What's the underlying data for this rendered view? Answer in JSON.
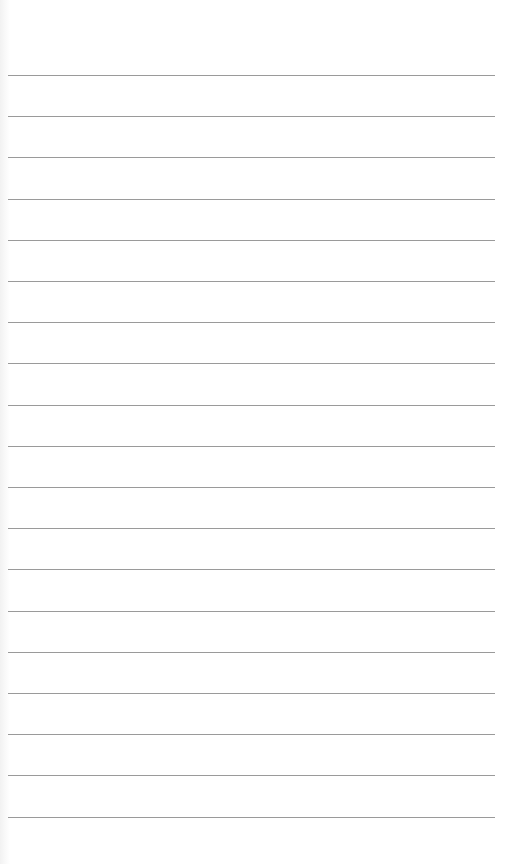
{
  "page": {
    "type": "lined-paper",
    "background_color": "#ffffff",
    "line_color": "#9a9a9a",
    "line_left": 8,
    "line_width": 487,
    "first_line_y": 75,
    "line_spacing": 41.2,
    "line_count": 19
  }
}
